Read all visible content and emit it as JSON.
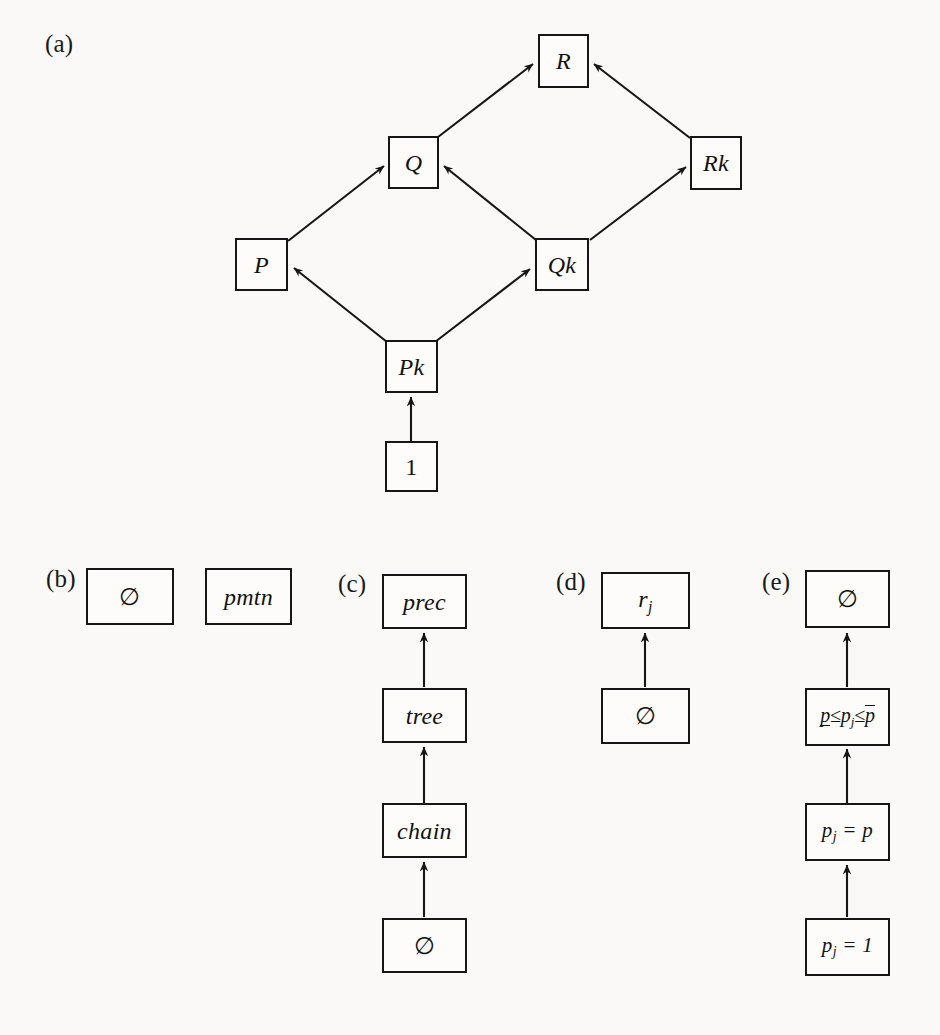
{
  "figure": {
    "background_color": "#faf9f7",
    "line_color": "#161616",
    "panels": [
      {
        "id": "a",
        "label": "(a)"
      },
      {
        "id": "b",
        "label": "(b)"
      },
      {
        "id": "c",
        "label": "(c)"
      },
      {
        "id": "d",
        "label": "(d)"
      },
      {
        "id": "e",
        "label": "(e)"
      }
    ]
  },
  "panel_a": {
    "label": "(a)",
    "nodes": {
      "R": "R",
      "Q": "Q",
      "Rk": "Rk",
      "P": "P",
      "Qk": "Qk",
      "Pk": "Pk",
      "one": "1"
    },
    "edges": [
      {
        "from": "Q",
        "to": "R"
      },
      {
        "from": "Rk",
        "to": "R"
      },
      {
        "from": "P",
        "to": "Q"
      },
      {
        "from": "Qk",
        "to": "Q"
      },
      {
        "from": "Qk",
        "to": "Rk"
      },
      {
        "from": "Pk",
        "to": "P"
      },
      {
        "from": "Pk",
        "to": "Qk"
      },
      {
        "from": "one",
        "to": "Pk"
      }
    ]
  },
  "panel_b": {
    "label": "(b)",
    "nodes": {
      "empty": "∅",
      "pmtn": "pmtn"
    },
    "edges": []
  },
  "panel_c": {
    "label": "(c)",
    "nodes": {
      "prec": "prec",
      "tree": "tree",
      "chain": "chain",
      "empty": "∅"
    },
    "edges": [
      {
        "from": "tree",
        "to": "prec"
      },
      {
        "from": "chain",
        "to": "tree"
      },
      {
        "from": "empty",
        "to": "chain"
      }
    ]
  },
  "panel_d": {
    "label": "(d)",
    "nodes": {
      "rj_base": "r",
      "rj_sub": "j",
      "empty": "∅"
    },
    "edges": [
      {
        "from": "empty",
        "to": "rj"
      }
    ]
  },
  "panel_e": {
    "label": "(e)",
    "nodes": {
      "empty": "∅",
      "bounds_p_lower": "p",
      "bounds_le1": "≤",
      "bounds_p_mid": "p",
      "bounds_sub_mid": "j",
      "bounds_le2": "≤",
      "bounds_p_upper": "p",
      "pj_eq_p_base": "p",
      "pj_eq_p_sub": "j",
      "pj_eq_p_rest": "= p",
      "pj_eq_1_base": "p",
      "pj_eq_1_sub": "j",
      "pj_eq_1_rest": "= 1"
    },
    "edges": [
      {
        "from": "pj_eq_1",
        "to": "pj_eq_p"
      },
      {
        "from": "pj_eq_p",
        "to": "bounds"
      },
      {
        "from": "bounds",
        "to": "empty"
      }
    ]
  }
}
